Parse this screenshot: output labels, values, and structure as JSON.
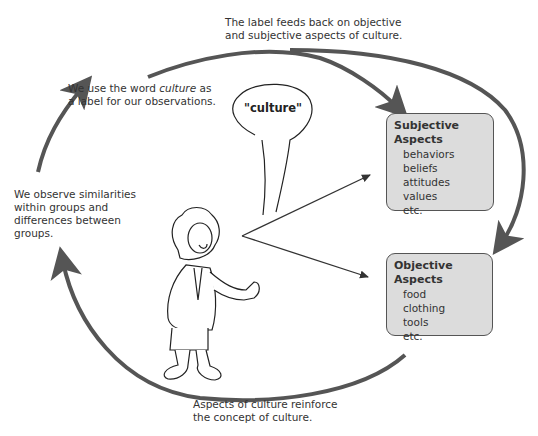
{
  "captions": {
    "top": [
      "The label feeds back on objective",
      "and subjective aspects of culture."
    ],
    "label_line1_pre": "We use the word ",
    "label_line1_em": "culture",
    "label_line1_post": " as",
    "label_line2": "a label for our observations.",
    "observe": [
      "We observe similarities",
      "within groups and",
      "differences between",
      "groups."
    ],
    "bottom": [
      "Aspects of culture reinforce",
      "the concept of culture."
    ]
  },
  "speech_bubble": {
    "text": "\"culture\""
  },
  "subjective_box": {
    "title": "Subjective Aspects",
    "items": [
      "behaviors",
      "beliefs",
      "attitudes",
      "values",
      "etc."
    ]
  },
  "objective_box": {
    "title": "Objective Aspects",
    "items": [
      "food",
      "clothing",
      "tools",
      "etc."
    ]
  },
  "colors": {
    "arrow": "#555555",
    "box_fill": "#dcdcdc",
    "box_border": "#555555"
  }
}
